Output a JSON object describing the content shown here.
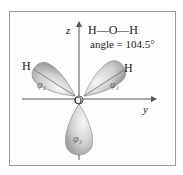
{
  "diagram": {
    "title_line1": "H—O—H",
    "title_line2": "angle = 104.5°",
    "axes": {
      "z": "z",
      "y": "y"
    },
    "atoms": {
      "center": "O",
      "left_h": "H",
      "right_h": "H"
    },
    "orbitals": [
      {
        "id": "phi1",
        "label": "φ₁"
      },
      {
        "id": "phi2",
        "label": "φ₂"
      },
      {
        "id": "phi3",
        "label": "φ₃"
      }
    ],
    "colors": {
      "lobe_light": "#f2f2f2",
      "lobe_dark": "#a8a8a8",
      "axis": "#555555",
      "frame": "#9a9a9a"
    }
  }
}
